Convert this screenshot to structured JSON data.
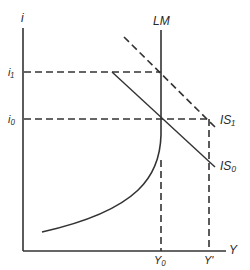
{
  "diagram": {
    "type": "IS-LM diagram",
    "axes": {
      "y_axis_label": "i",
      "x_axis_label": "Y"
    },
    "curves": {
      "lm_label": "LM",
      "is0_label": "IS₀",
      "is1_label": "IS₁"
    },
    "levels": {
      "i1_label": "i₁",
      "i0_label": "i₀",
      "y0_label": "Y₀",
      "yprime_label": "Y'"
    },
    "colors": {
      "line": "#333333",
      "background": "#ffffff"
    }
  }
}
